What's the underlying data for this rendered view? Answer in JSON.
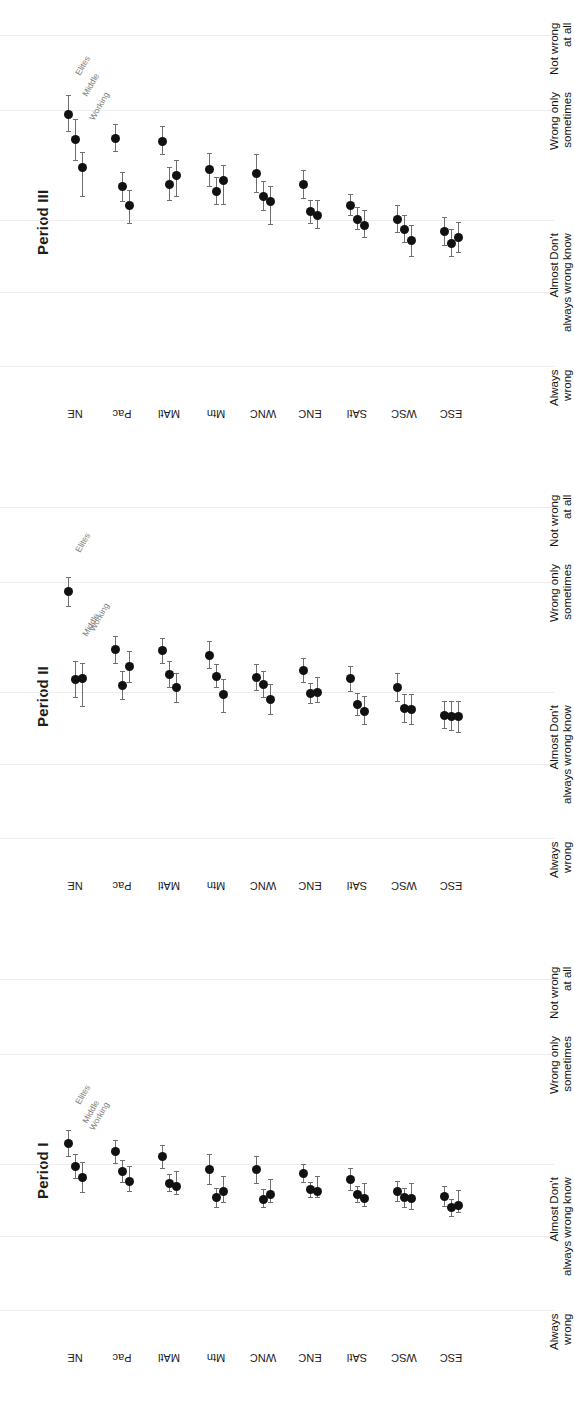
{
  "figure": {
    "orientation": "rotated-90",
    "background": "#ffffff",
    "marker_color": "#111111",
    "whisker_color": "#6f6f6f",
    "gridline_color": "#ededed"
  },
  "panels": [
    {
      "title": "Period III"
    },
    {
      "title": "Period II"
    },
    {
      "title": "Period I"
    }
  ],
  "scale": {
    "ticks": [
      {
        "line1": "Not wrong",
        "line2": "at all",
        "value": 5
      },
      {
        "line1": "Wrong only",
        "line2": "sometimes",
        "value": 4
      },
      {
        "line1": "Don't",
        "line2": "know",
        "value": 3
      },
      {
        "line1": "Almost",
        "line2": "always wrong",
        "value": 2
      },
      {
        "line1": "Always",
        "line2": "wrong",
        "value": 1
      }
    ]
  },
  "series": [
    {
      "name": "Elites",
      "label": "Elites"
    },
    {
      "name": "Middle",
      "label": "Middle"
    },
    {
      "name": "Working",
      "label": "Working"
    }
  ],
  "regions": [
    "NE",
    "Pac",
    "MAtl",
    "Mtn",
    "WNC",
    "ENC",
    "SAtl",
    "WSC",
    "ESC"
  ],
  "chart_data": {
    "type": "scatter",
    "xlabel": "Region",
    "ylabel": "",
    "ylim": [
      1,
      5
    ],
    "grid": true,
    "legend": [
      "Elites",
      "Middle",
      "Working"
    ],
    "legend_position": "inline-first-group",
    "categories": [
      "NE",
      "Pac",
      "MAtl",
      "Mtn",
      "WNC",
      "ENC",
      "SAtl",
      "WSC",
      "ESC"
    ],
    "tick_labels": [
      "Always wrong",
      "Almost always wrong",
      "Don't know",
      "Wrong only sometimes",
      "Not wrong at all"
    ],
    "panels": [
      {
        "title": "Period III",
        "series": [
          {
            "name": "Elites",
            "values": [
              4.05,
              3.76,
              3.72,
              3.38,
              3.33,
              3.2,
              2.95,
              2.78,
              2.63
            ],
            "lower": [
              3.84,
              3.6,
              3.56,
              3.17,
              3.1,
              3.03,
              2.82,
              2.62,
              2.46
            ],
            "upper": [
              4.27,
              3.92,
              3.9,
              3.58,
              3.56,
              3.37,
              3.08,
              2.94,
              2.8
            ]
          },
          {
            "name": "Middle",
            "values": [
              3.74,
              3.17,
              3.2,
              3.12,
              3.06,
              2.87,
              2.78,
              2.66,
              2.49
            ],
            "lower": [
              3.49,
              2.99,
              3.01,
              2.96,
              2.88,
              2.73,
              2.65,
              2.5,
              2.33
            ],
            "upper": [
              3.99,
              3.35,
              3.4,
              3.29,
              3.23,
              3.01,
              2.92,
              2.82,
              2.66
            ]
          },
          {
            "name": "Working",
            "values": [
              3.41,
              2.95,
              3.31,
              3.25,
              2.99,
              2.83,
              2.7,
              2.52,
              2.56
            ],
            "lower": [
              3.06,
              2.73,
              3.05,
              2.96,
              2.72,
              2.67,
              2.56,
              2.33,
              2.38
            ]
          }
        ]
      },
      {
        "title": "Period II",
        "series": [
          {
            "name": "Elites",
            "values": [
              3.98,
              3.28,
              3.27,
              3.21,
              2.94,
              3.03,
              2.93,
              2.83,
              2.49
            ],
            "lower": [
              3.8,
              3.12,
              3.12,
              3.05,
              2.79,
              2.89,
              2.78,
              2.66,
              2.33
            ],
            "upper": [
              4.16,
              3.44,
              3.42,
              3.38,
              3.1,
              3.17,
              3.08,
              3.0,
              2.66
            ]
          },
          {
            "name": "Middle",
            "values": [
              2.92,
              2.85,
              2.98,
              2.96,
              2.86,
              2.75,
              2.62,
              2.57,
              2.48
            ],
            "lower": [
              2.7,
              2.68,
              2.82,
              2.82,
              2.7,
              2.63,
              2.49,
              2.4,
              2.3
            ],
            "upper": [
              3.14,
              3.02,
              3.14,
              3.1,
              3.02,
              2.87,
              2.75,
              2.74,
              2.66
            ]
          },
          {
            "name": "Working",
            "values": [
              2.93,
              3.08,
              2.82,
              2.74,
              2.68,
              2.76,
              2.53,
              2.56,
              2.47
            ],
            "lower": [
              2.6,
              2.88,
              2.64,
              2.52,
              2.5,
              2.64,
              2.38,
              2.38,
              2.28
            ]
          }
        ]
      },
      {
        "title": "Period I",
        "series": [
          {
            "name": "Elites",
            "values": [
              3.02,
              2.92,
              2.86,
              2.7,
              2.7,
              2.66,
              2.58,
              2.44,
              2.38
            ],
            "lower": [
              2.86,
              2.78,
              2.72,
              2.52,
              2.54,
              2.55,
              2.45,
              2.32,
              2.26
            ],
            "upper": [
              3.18,
              3.06,
              3.0,
              2.88,
              2.86,
              2.77,
              2.71,
              2.56,
              2.5
            ]
          },
          {
            "name": "Middle",
            "values": [
              2.74,
              2.68,
              2.54,
              2.36,
              2.34,
              2.46,
              2.4,
              2.36,
              2.24
            ],
            "lower": [
              2.6,
              2.55,
              2.44,
              2.24,
              2.24,
              2.37,
              2.3,
              2.24,
              2.14
            ],
            "upper": [
              2.88,
              2.81,
              2.64,
              2.48,
              2.46,
              2.55,
              2.5,
              2.48,
              2.34
            ]
          },
          {
            "name": "Working",
            "values": [
              2.61,
              2.56,
              2.5,
              2.44,
              2.4,
              2.44,
              2.35,
              2.35,
              2.27
            ],
            "lower": [
              2.42,
              2.44,
              2.4,
              2.3,
              2.3,
              2.36,
              2.26,
              2.22,
              2.18
            ]
          }
        ]
      }
    ]
  }
}
